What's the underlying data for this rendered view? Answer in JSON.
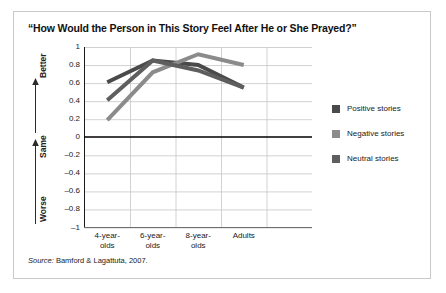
{
  "title": "“How Would the Person in This Story Feel After He or She Prayed?”",
  "source": {
    "prefix": "Source:",
    "text": " Bamford & Lagattuta, 2007."
  },
  "legend": {
    "position": "right",
    "items": [
      {
        "label": "Positive stories",
        "color": "#4a4a4a",
        "icon": "legend-swatch-icon"
      },
      {
        "label": "Negative stories",
        "color": "#8b8b8b",
        "icon": "legend-swatch-icon"
      },
      {
        "label": "Neutral stories",
        "color": "#5e5e5e",
        "icon": "legend-swatch-icon"
      }
    ]
  },
  "axes": {
    "y_direction_labels": [
      "Better",
      "Same",
      "Worse"
    ],
    "y_ticks": [
      "1",
      "0.8",
      "0.6",
      "0.4",
      "0.2",
      "0",
      "–0.2",
      "–0.4",
      "–0.6",
      "–0.8",
      "–1"
    ],
    "x_ticks": [
      {
        "line1": "4-year-",
        "line2": "olds"
      },
      {
        "line1": "6-year-",
        "line2": "olds"
      },
      {
        "line1": "8-year-",
        "line2": "olds"
      },
      {
        "line1": "Adults",
        "line2": ""
      }
    ]
  },
  "chart_data": {
    "type": "line",
    "title": "“How Would the Person in This Story Feel After He or She Prayed?”",
    "xlabel": "",
    "ylabel": "",
    "categories": [
      "4-year-olds",
      "6-year-olds",
      "8-year-olds",
      "Adults"
    ],
    "series": [
      {
        "name": "Positive stories",
        "color": "#4a4a4a",
        "values": [
          0.61,
          0.85,
          0.8,
          0.55
        ]
      },
      {
        "name": "Negative stories",
        "color": "#8b8b8b",
        "values": [
          0.19,
          0.72,
          0.92,
          0.8
        ]
      },
      {
        "name": "Neutral stories",
        "color": "#5e5e5e",
        "values": [
          0.41,
          0.85,
          0.74,
          0.55
        ]
      }
    ],
    "ylim": [
      -1,
      1
    ],
    "ytick_values": [
      1,
      0.8,
      0.6,
      0.4,
      0.2,
      0,
      -0.2,
      -0.4,
      -0.6,
      -0.8,
      -1
    ],
    "grid": true,
    "zero_line": true,
    "legend_position": "right",
    "annotations": [
      "Better",
      "Same",
      "Worse"
    ],
    "source": "Source: Bamford & Lagattuta, 2007."
  }
}
